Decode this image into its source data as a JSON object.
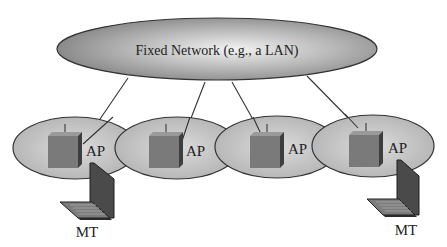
{
  "diagram": {
    "fixed_network": {
      "label": "Fixed Network (e.g., a LAN)"
    },
    "access_points": [
      {
        "label": "AP"
      },
      {
        "label": "AP"
      },
      {
        "label": "AP"
      },
      {
        "label": "AP"
      }
    ],
    "mobile_terminals": [
      {
        "label": "MT"
      },
      {
        "label": "MT"
      }
    ],
    "colors": {
      "ellipse_fill_dark": "#8a8a8a",
      "ellipse_fill_light": "#f0f0f0",
      "cell_fill": "#c4c4c4",
      "box_front": "#7a7a7a",
      "box_side": "#3e3e3e",
      "laptop_screen": "#4a4a4a",
      "outline": "#333333"
    }
  }
}
